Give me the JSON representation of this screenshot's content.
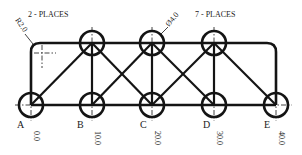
{
  "annotations": {
    "radius_note": "2 - PLACES",
    "radius_value": "R2.0",
    "hole_note": "7 - PLACES",
    "hole_value": "Ø4.0"
  },
  "nodes": {
    "bottom": [
      {
        "label": "A",
        "coord": "0.0"
      },
      {
        "label": "B",
        "coord": "10.0"
      },
      {
        "label": "C",
        "coord": "20.0"
      },
      {
        "label": "D",
        "coord": "30.0"
      },
      {
        "label": "E",
        "coord": "40.0"
      }
    ],
    "top_count": 3
  },
  "colors": {
    "line": "#141414",
    "background": "#ffffff"
  }
}
